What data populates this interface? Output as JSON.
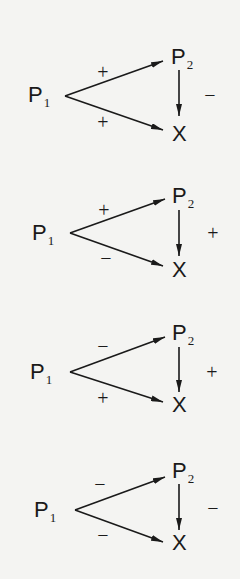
{
  "diagrams": [
    {
      "source": {
        "label": "P",
        "sub": "1"
      },
      "mediator": {
        "label": "P",
        "sub": "2"
      },
      "target": {
        "label": "X"
      },
      "signs": {
        "p1_to_p2": "+",
        "p1_to_x": "+",
        "p2_to_x": "−"
      }
    },
    {
      "source": {
        "label": "P",
        "sub": "1"
      },
      "mediator": {
        "label": "P",
        "sub": "2"
      },
      "target": {
        "label": "X"
      },
      "signs": {
        "p1_to_p2": "+",
        "p1_to_x": "−",
        "p2_to_x": "+"
      }
    },
    {
      "source": {
        "label": "P",
        "sub": "1"
      },
      "mediator": {
        "label": "P",
        "sub": "2"
      },
      "target": {
        "label": "X"
      },
      "signs": {
        "p1_to_p2": "−",
        "p1_to_x": "+",
        "p2_to_x": "+"
      }
    },
    {
      "source": {
        "label": "P",
        "sub": "1"
      },
      "mediator": {
        "label": "P",
        "sub": "2"
      },
      "target": {
        "label": "X"
      },
      "signs": {
        "p1_to_p2": "−",
        "p1_to_x": "−",
        "p2_to_x": "−"
      }
    }
  ]
}
